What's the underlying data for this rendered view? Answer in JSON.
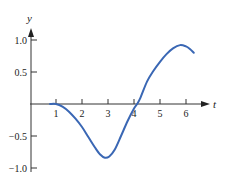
{
  "chart_data": {
    "type": "line",
    "title": "",
    "xlabel": "t",
    "ylabel": "y",
    "xlim": [
      0,
      6.6
    ],
    "ylim": [
      -1.0,
      1.0
    ],
    "grid": false,
    "legend": null,
    "x_ticks": [
      1,
      2,
      3,
      4,
      5,
      6
    ],
    "x_tick_labels": [
      "1",
      "2",
      "3",
      "4",
      "5",
      "6"
    ],
    "y_ticks": [
      1.0,
      0.5,
      -0.5,
      -1.0
    ],
    "y_tick_labels": [
      "1.0",
      "0.5",
      "-0.5",
      "-1.0"
    ],
    "series": [
      {
        "name": "y(t)",
        "color": "#3a67b4",
        "x": [
          0.77,
          1.0,
          1.25,
          1.5,
          1.75,
          2.0,
          2.25,
          2.5,
          2.7,
          2.88,
          3.05,
          3.25,
          3.5,
          3.75,
          4.0,
          4.12,
          4.25,
          4.5,
          4.75,
          5.0,
          5.25,
          5.5,
          5.77,
          6.0,
          6.15,
          6.3
        ],
        "values": [
          0.0,
          0.0,
          -0.04,
          -0.12,
          -0.23,
          -0.36,
          -0.52,
          -0.68,
          -0.79,
          -0.84,
          -0.82,
          -0.72,
          -0.5,
          -0.27,
          -0.07,
          0.0,
          0.1,
          0.35,
          0.52,
          0.66,
          0.78,
          0.87,
          0.92,
          0.9,
          0.86,
          0.8
        ]
      }
    ]
  },
  "axes": {
    "x_label": "t",
    "y_label": "y"
  }
}
